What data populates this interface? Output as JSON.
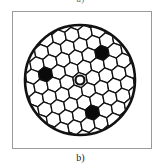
{
  "figure": {
    "top_label": "a)",
    "caption": "b)",
    "colors": {
      "line": "#111111",
      "fill_dark": "#0a0a0a",
      "background": "#ffffff",
      "frame": "#9a9a9a"
    },
    "outer_circle": {
      "cx": 80,
      "cy": 80,
      "r": 55
    },
    "center_ring": {
      "cx": 80,
      "cy": 80,
      "r": 4.5
    },
    "dark_cells": [
      {
        "cx": 51,
        "cy": 71
      },
      {
        "cx": 103,
        "cy": 57
      },
      {
        "cx": 88,
        "cy": 110
      }
    ],
    "lattice_pitch": 13.2
  }
}
